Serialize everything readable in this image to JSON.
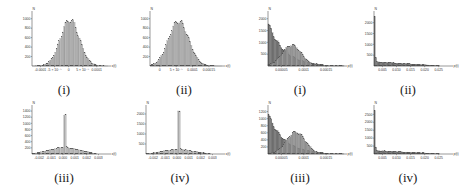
{
  "chart_data": [
    {
      "id": "left-i",
      "type": "bar",
      "caption": "(i)",
      "ylabel": "N",
      "xlabel": "x(t)",
      "yticks": [
        200,
        400,
        600,
        800,
        1000
      ],
      "ylim": [
        0,
        1100
      ],
      "xticks": [
        "-0.0001",
        "-5 × 10⁻⁵",
        "0",
        "5 × 10⁻⁵",
        "0.0001"
      ],
      "xlim": [
        -0.00012,
        0.00012
      ],
      "shape": "gaussian",
      "center": 0.0,
      "width": 3e-05,
      "peak": 980,
      "color": "#b8b8b8",
      "box": {
        "x": 22,
        "y": 8,
        "w": 92,
        "h": 70
      },
      "cap": {
        "x": 34,
        "y": 82
      }
    },
    {
      "id": "left-ii",
      "type": "bar",
      "caption": "(ii)",
      "ylabel": "N",
      "xlabel": "x(t)",
      "yticks": [
        200,
        400,
        600,
        800,
        1000
      ],
      "ylim": [
        0,
        1100
      ],
      "xticks": [
        "0",
        "5 × 10⁻⁵",
        "0.0001",
        "0.00015"
      ],
      "xlim": [
        -2e-05,
        0.00018
      ],
      "shape": "gaussian",
      "center": 6e-05,
      "width": 2.8e-05,
      "peak": 950,
      "color": "#b8b8b8",
      "box": {
        "x": 140,
        "y": 8,
        "w": 88,
        "h": 70
      },
      "cap": {
        "x": 154,
        "y": 82
      }
    },
    {
      "id": "left-iii",
      "type": "bar",
      "caption": "(iii)",
      "ylabel": "N",
      "xlabel": "x(t)",
      "yticks": [
        200,
        400,
        600,
        800,
        1000,
        1200,
        1400
      ],
      "ylim": [
        0,
        1500
      ],
      "xticks": [
        "-0.002",
        "-0.001",
        "0.000",
        "0.001",
        "0.002",
        "0.003"
      ],
      "xlim": [
        -0.0025,
        0.0033
      ],
      "shape": "spike",
      "center": 0.0,
      "spike": [
        1250,
        1300
      ],
      "base_peak": 240,
      "base_halfwidth": 0.0025,
      "color": "#c4c4c4",
      "box": {
        "x": 22,
        "y": 102,
        "w": 92,
        "h": 64
      },
      "cap": {
        "x": 34,
        "y": 170
      }
    },
    {
      "id": "left-iv",
      "type": "bar",
      "caption": "(iv)",
      "ylabel": "N",
      "xlabel": "x(t)",
      "yticks": [
        500,
        1000,
        1500,
        2000
      ],
      "ylim": [
        0,
        2300
      ],
      "xticks": [
        "-0.002",
        "-0.001",
        "0.000",
        "0.001",
        "0.002",
        "0.003"
      ],
      "xlim": [
        -0.0025,
        0.0033
      ],
      "shape": "spike",
      "center": 0.0,
      "spike": [
        2150
      ],
      "base_peak": 260,
      "base_halfwidth": 0.0025,
      "color": "#c4c4c4",
      "box": {
        "x": 136,
        "y": 102,
        "w": 92,
        "h": 64
      },
      "cap": {
        "x": 150,
        "y": 170
      }
    },
    {
      "id": "right-i",
      "type": "bar",
      "caption": "(i)",
      "ylabel": "N",
      "xlabel": "p(t)",
      "yticks": [
        500,
        1000,
        1500,
        2000
      ],
      "ylim": [
        0,
        2200
      ],
      "xticks": [
        "0.00005",
        "0.0001",
        "0.00015"
      ],
      "xlim": [
        0,
        0.00019
      ],
      "series": [
        {
          "name": "dark",
          "shape": "decay",
          "peak": 1850,
          "scale": 4e-05,
          "color": "#6f6f6f"
        },
        {
          "name": "light",
          "shape": "gaussian",
          "center": 6e-05,
          "width": 2.4e-05,
          "peak": 880,
          "color": "#9a9a9a"
        }
      ],
      "box": {
        "x": 258,
        "y": 8,
        "w": 92,
        "h": 70
      },
      "cap": {
        "x": 270,
        "y": 82
      }
    },
    {
      "id": "right-ii",
      "type": "bar",
      "caption": "(ii)",
      "ylabel": "N",
      "xlabel": "p(t)",
      "yticks": [
        500,
        1000,
        1500,
        2000
      ],
      "ylim": [
        0,
        2400
      ],
      "xticks": [
        "0.005",
        "0.010",
        "0.015",
        "0.020",
        "0.025"
      ],
      "xlim": [
        0,
        0.03
      ],
      "shape": "spike-decay",
      "spike": 2300,
      "base_peak": 200,
      "color": "#6f6f6f",
      "box": {
        "x": 364,
        "y": 8,
        "w": 92,
        "h": 70
      },
      "cap": {
        "x": 378,
        "y": 82
      }
    },
    {
      "id": "right-iii",
      "type": "bar",
      "caption": "(iii)",
      "ylabel": "N",
      "xlabel": "p(t)",
      "yticks": [
        200,
        400,
        600,
        800,
        1000,
        1200
      ],
      "ylim": [
        0,
        1300
      ],
      "xticks": [
        "0.00005",
        "0.0001",
        "0.00015"
      ],
      "xlim": [
        0,
        0.00019
      ],
      "series": [
        {
          "name": "dark",
          "shape": "decay",
          "peak": 1150,
          "scale": 4e-05,
          "color": "#6f6f6f"
        },
        {
          "name": "light",
          "shape": "gaussian",
          "center": 7e-05,
          "width": 2.4e-05,
          "peak": 620,
          "color": "#9a9a9a"
        }
      ],
      "box": {
        "x": 258,
        "y": 102,
        "w": 92,
        "h": 64
      },
      "cap": {
        "x": 270,
        "y": 170
      }
    },
    {
      "id": "right-iv",
      "type": "bar",
      "caption": "(iv)",
      "ylabel": "N",
      "xlabel": "p(t)",
      "yticks": [
        500,
        1000,
        1500,
        2000,
        2500
      ],
      "ylim": [
        0,
        2900
      ],
      "xticks": [
        "0.005",
        "0.010",
        "0.015",
        "0.020",
        "0.025"
      ],
      "xlim": [
        0,
        0.03
      ],
      "shape": "spike-decay",
      "spike": 2750,
      "base_peak": 220,
      "color": "#6f6f6f",
      "box": {
        "x": 364,
        "y": 102,
        "w": 92,
        "h": 64
      },
      "cap": {
        "x": 378,
        "y": 170
      }
    }
  ]
}
